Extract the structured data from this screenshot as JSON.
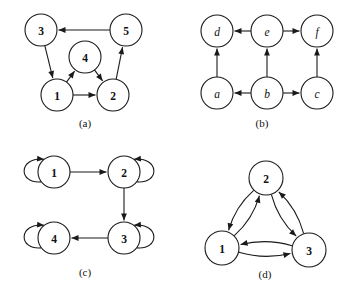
{
  "figure": {
    "background_color": "#ffffff",
    "stroke_color": "#1a1a1a",
    "label_color": "#111111",
    "panels": [
      {
        "id": "panel-a",
        "caption": "(a)",
        "caption_pos": {
          "x": 85,
          "y": 123
        },
        "node_radius": 16,
        "nodes": [
          {
            "id": "3",
            "label": "3",
            "x": 41,
            "y": 30,
            "style": "upright"
          },
          {
            "id": "5",
            "label": "5",
            "x": 126,
            "y": 30,
            "style": "upright"
          },
          {
            "id": "4",
            "label": "4",
            "x": 85,
            "y": 57,
            "style": "upright"
          },
          {
            "id": "1",
            "label": "1",
            "x": 57,
            "y": 95,
            "style": "upright"
          },
          {
            "id": "2",
            "label": "2",
            "x": 113,
            "y": 95,
            "style": "upright"
          }
        ],
        "edges": [
          {
            "from": "5",
            "to": "3",
            "kind": "straight"
          },
          {
            "from": "3",
            "to": "1",
            "kind": "straight"
          },
          {
            "from": "1",
            "to": "4",
            "kind": "straight"
          },
          {
            "from": "4",
            "to": "2",
            "kind": "straight"
          },
          {
            "from": "1",
            "to": "2",
            "kind": "straight"
          },
          {
            "from": "2",
            "to": "5",
            "kind": "straight"
          }
        ]
      },
      {
        "id": "panel-b",
        "caption": "(b)",
        "caption_pos": {
          "x": 262,
          "y": 123
        },
        "node_radius": 16,
        "nodes": [
          {
            "id": "d",
            "label": "d",
            "x": 217,
            "y": 31,
            "style": "italic"
          },
          {
            "id": "e",
            "label": "e",
            "x": 267,
            "y": 31,
            "style": "italic"
          },
          {
            "id": "f",
            "label": "f",
            "x": 317,
            "y": 31,
            "style": "italic"
          },
          {
            "id": "a",
            "label": "a",
            "x": 217,
            "y": 93,
            "style": "italic"
          },
          {
            "id": "b",
            "label": "b",
            "x": 267,
            "y": 93,
            "style": "italic"
          },
          {
            "id": "c",
            "label": "c",
            "x": 317,
            "y": 93,
            "style": "italic"
          }
        ],
        "edges": [
          {
            "from": "e",
            "to": "d",
            "kind": "straight"
          },
          {
            "from": "e",
            "to": "f",
            "kind": "straight"
          },
          {
            "from": "b",
            "to": "a",
            "kind": "straight"
          },
          {
            "from": "b",
            "to": "c",
            "kind": "straight"
          },
          {
            "from": "a",
            "to": "d",
            "kind": "straight"
          },
          {
            "from": "b",
            "to": "e",
            "kind": "straight"
          },
          {
            "from": "c",
            "to": "f",
            "kind": "straight"
          }
        ]
      },
      {
        "id": "panel-c",
        "caption": "(c)",
        "caption_pos": {
          "x": 85,
          "y": 272
        },
        "node_radius": 16,
        "nodes": [
          {
            "id": "1",
            "label": "1",
            "x": 54,
            "y": 172,
            "style": "upright"
          },
          {
            "id": "2",
            "label": "2",
            "x": 124,
            "y": 172,
            "style": "upright"
          },
          {
            "id": "3",
            "label": "3",
            "x": 124,
            "y": 238,
            "style": "upright"
          },
          {
            "id": "4",
            "label": "4",
            "x": 54,
            "y": 238,
            "style": "upright"
          }
        ],
        "edges": [
          {
            "from": "1",
            "to": "2",
            "kind": "straight"
          },
          {
            "from": "2",
            "to": "3",
            "kind": "straight"
          },
          {
            "from": "3",
            "to": "4",
            "kind": "straight"
          }
        ],
        "self_loops": [
          {
            "node": "1",
            "side": "left"
          },
          {
            "node": "2",
            "side": "right"
          },
          {
            "node": "3",
            "side": "right"
          },
          {
            "node": "4",
            "side": "left"
          }
        ]
      },
      {
        "id": "panel-d",
        "caption": "(d)",
        "caption_pos": {
          "x": 265,
          "y": 274
        },
        "node_radius": 17,
        "nodes": [
          {
            "id": "2",
            "label": "2",
            "x": 266,
            "y": 178,
            "style": "upright"
          },
          {
            "id": "1",
            "label": "1",
            "x": 222,
            "y": 248,
            "style": "upright"
          },
          {
            "id": "3",
            "label": "3",
            "x": 309,
            "y": 250,
            "style": "upright"
          }
        ],
        "edges": [
          {
            "from": "1",
            "to": "2",
            "kind": "curved"
          },
          {
            "from": "2",
            "to": "1",
            "kind": "curved"
          },
          {
            "from": "2",
            "to": "3",
            "kind": "curved"
          },
          {
            "from": "3",
            "to": "2",
            "kind": "curved"
          },
          {
            "from": "1",
            "to": "3",
            "kind": "curved"
          },
          {
            "from": "3",
            "to": "1",
            "kind": "curved"
          }
        ]
      }
    ]
  }
}
